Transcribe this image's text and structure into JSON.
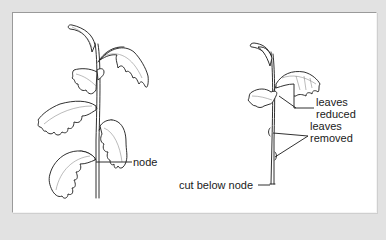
{
  "figure": {
    "background_color": "#e2e2e2",
    "panel_color": "#ffffff",
    "ink_color": "#1a1a1a"
  },
  "left_plant": {
    "description": "whole plant stem with leaves",
    "labels": {
      "node": "node"
    }
  },
  "right_plant": {
    "description": "prepared stem cutting",
    "labels": {
      "leaves_reduced_line1": "leaves",
      "leaves_reduced_line2": "reduced",
      "leaves_removed_line1": "leaves",
      "leaves_removed_line2": "removed",
      "cut_below_node": "cut below node"
    }
  }
}
